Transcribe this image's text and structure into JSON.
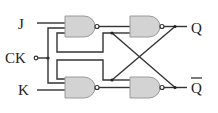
{
  "diagram": {
    "labels": {
      "j": "J",
      "ck": "CK",
      "k": "K",
      "q": "Q",
      "q_bar": "Q"
    },
    "gates": [
      {
        "id": "nand-1",
        "type": "NAND",
        "position": "top-left"
      },
      {
        "id": "nand-2",
        "type": "NAND",
        "position": "top-right"
      },
      {
        "id": "nand-3",
        "type": "NAND",
        "position": "bottom-left"
      },
      {
        "id": "nand-4",
        "type": "NAND",
        "position": "bottom-right"
      }
    ],
    "colors": {
      "gate_fill": "#d3d3d3",
      "wire": "#333333",
      "background": "#ffffff"
    }
  }
}
